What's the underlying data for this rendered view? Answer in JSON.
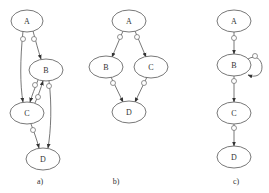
{
  "figure": {
    "panels": [
      {
        "caption": "a)",
        "nodes": [
          {
            "id": "A",
            "label": "A"
          },
          {
            "id": "B",
            "label": "B"
          },
          {
            "id": "C",
            "label": "C"
          },
          {
            "id": "D",
            "label": "D"
          }
        ],
        "edges": [
          {
            "from": "A",
            "to": "C",
            "marker": "circle"
          },
          {
            "from": "A",
            "to": "B",
            "marker": "circle"
          },
          {
            "from": "B",
            "to": "C",
            "marker": "circle"
          },
          {
            "from": "C",
            "to": "B",
            "marker": "circle"
          },
          {
            "from": "B",
            "to": "D",
            "marker": "circle"
          },
          {
            "from": "C",
            "to": "D",
            "marker": "circle"
          }
        ]
      },
      {
        "caption": "b)",
        "nodes": [
          {
            "id": "A",
            "label": "A"
          },
          {
            "id": "B",
            "label": "B"
          },
          {
            "id": "C",
            "label": "C"
          },
          {
            "id": "D",
            "label": "D"
          }
        ],
        "edges": [
          {
            "from": "A",
            "to": "B",
            "marker": "circle"
          },
          {
            "from": "A",
            "to": "C",
            "marker": "circle"
          },
          {
            "from": "B",
            "to": "D",
            "marker": "circle"
          },
          {
            "from": "C",
            "to": "D",
            "marker": "circle"
          }
        ]
      },
      {
        "caption": "c)",
        "nodes": [
          {
            "id": "A",
            "label": "A"
          },
          {
            "id": "B",
            "label": "B"
          },
          {
            "id": "C",
            "label": "C"
          },
          {
            "id": "D",
            "label": "D"
          }
        ],
        "edges": [
          {
            "from": "A",
            "to": "B",
            "marker": "circle"
          },
          {
            "from": "B",
            "to": "B",
            "marker": "circle"
          },
          {
            "from": "B",
            "to": "C",
            "marker": "circle"
          },
          {
            "from": "C",
            "to": "D",
            "marker": "circle"
          }
        ]
      }
    ]
  }
}
